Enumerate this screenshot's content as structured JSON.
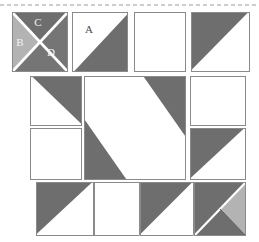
{
  "figure": {
    "type": "diagram",
    "canvas": {
      "width": 259,
      "height": 242
    },
    "background_color": "#ffffff"
  },
  "palette": {
    "white": "#ffffff",
    "dark_gray": "#6e6e6e",
    "mid_gray": "#757575",
    "light_gray": "#b3b3b3",
    "outline": "#8a8a8a",
    "seam_white": "#ffffff",
    "label_light": "#f2f2f2",
    "label_dark": "#4a4a4a",
    "dashed_rule": "#9a9a9a"
  },
  "top_rule": {
    "style": "dashed",
    "y": 5,
    "x_start": 0,
    "x_end": 259
  },
  "labels": [
    {
      "text": "A",
      "x": 89,
      "y": 30,
      "tone": "dark",
      "name": "patch-label-a"
    },
    {
      "text": "B",
      "x": 20,
      "y": 43,
      "tone": "light",
      "name": "patch-label-b"
    },
    {
      "text": "C",
      "x": 38,
      "y": 23,
      "tone": "light",
      "name": "patch-label-c"
    },
    {
      "text": "D",
      "x": 51,
      "y": 53,
      "tone": "light",
      "name": "patch-label-d"
    }
  ],
  "grid": {
    "rows": 3,
    "row_bounds": [
      [
        12,
        72
      ],
      [
        76,
        180
      ],
      [
        182,
        236
      ]
    ],
    "note": "3 horizontal bands; middle band is a 3-column arrangement with a double-height center"
  },
  "blocks": {
    "top_row": [
      {
        "name": "block-quarter-square-triangles",
        "rect": [
          12,
          12,
          56,
          60
        ],
        "pattern": "quarter-square-triangles",
        "patches": [
          {
            "id": "C",
            "position": "top",
            "fill": "dark_gray"
          },
          {
            "id": "B",
            "position": "left",
            "fill": "light_gray"
          },
          {
            "id": "D",
            "position": "right-bottom",
            "fill": "mid_gray"
          }
        ]
      },
      {
        "name": "block-half-square-a",
        "rect": [
          72,
          12,
          56,
          60
        ],
        "pattern": "half-square-triangle",
        "patches": [
          {
            "id": "A",
            "position": "upper-left",
            "fill": "white"
          },
          {
            "id": "",
            "position": "lower-right",
            "fill": "dark_gray"
          }
        ]
      },
      {
        "name": "block-plain-white",
        "rect": [
          134,
          12,
          52,
          60
        ],
        "pattern": "plain",
        "patches": [
          {
            "id": "",
            "position": "full",
            "fill": "white"
          }
        ]
      },
      {
        "name": "block-half-square-mirror",
        "rect": [
          191,
          12,
          59,
          60
        ],
        "pattern": "half-square-triangle",
        "patches": [
          {
            "id": "",
            "position": "upper-left",
            "fill": "dark_gray"
          },
          {
            "id": "",
            "position": "lower-right",
            "fill": "white"
          }
        ]
      }
    ],
    "middle_row": [
      {
        "name": "block-left-upper-hst",
        "rect": [
          30,
          76,
          52,
          50
        ],
        "pattern": "half-square-triangle",
        "patches": [
          {
            "id": "",
            "position": "upper-right",
            "fill": "dark_gray"
          },
          {
            "id": "",
            "position": "lower-left",
            "fill": "white"
          }
        ]
      },
      {
        "name": "block-left-lower-plain",
        "rect": [
          30,
          128,
          52,
          52
        ],
        "pattern": "plain",
        "patches": [
          {
            "id": "",
            "position": "full",
            "fill": "white"
          }
        ]
      },
      {
        "name": "block-center-diagonal-band",
        "rect": [
          84,
          76,
          102,
          104
        ],
        "pattern": "diagonal-band",
        "patches": [
          {
            "id": "",
            "position": "top-right-corner",
            "fill": "dark_gray"
          },
          {
            "id": "",
            "position": "bottom-left-corner",
            "fill": "dark_gray"
          },
          {
            "id": "",
            "position": "center-band",
            "fill": "white"
          }
        ]
      },
      {
        "name": "block-right-upper-plain",
        "rect": [
          190,
          76,
          56,
          50
        ],
        "pattern": "plain",
        "patches": [
          {
            "id": "",
            "position": "full",
            "fill": "white"
          }
        ]
      },
      {
        "name": "block-right-lower-hst",
        "rect": [
          190,
          128,
          56,
          52
        ],
        "pattern": "half-square-triangle",
        "patches": [
          {
            "id": "",
            "position": "upper-left",
            "fill": "dark_gray"
          },
          {
            "id": "",
            "position": "lower-right",
            "fill": "white"
          }
        ]
      }
    ],
    "bottom_row": [
      {
        "name": "block-bottom-hst-1",
        "rect": [
          36,
          182,
          58,
          54
        ],
        "pattern": "half-square-triangle",
        "patches": [
          {
            "id": "",
            "position": "upper-left",
            "fill": "dark_gray"
          },
          {
            "id": "",
            "position": "lower-right",
            "fill": "white"
          }
        ]
      },
      {
        "name": "block-bottom-plain",
        "rect": [
          94,
          182,
          46,
          54
        ],
        "pattern": "plain",
        "patches": [
          {
            "id": "",
            "position": "full",
            "fill": "white"
          }
        ]
      },
      {
        "name": "block-bottom-hst-2",
        "rect": [
          140,
          182,
          54,
          54
        ],
        "pattern": "half-square-triangle",
        "patches": [
          {
            "id": "",
            "position": "upper-left",
            "fill": "dark_gray"
          },
          {
            "id": "",
            "position": "lower-right",
            "fill": "white"
          }
        ]
      },
      {
        "name": "block-bottom-corner-accent",
        "rect": [
          194,
          182,
          52,
          54
        ],
        "pattern": "corner-accent-triangles",
        "patches": [
          {
            "id": "",
            "position": "main",
            "fill": "dark_gray"
          },
          {
            "id": "",
            "position": "right-wedge",
            "fill": "light_gray"
          }
        ]
      }
    ]
  }
}
